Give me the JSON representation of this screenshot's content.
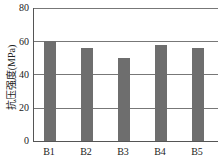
{
  "chart_data": {
    "type": "bar",
    "title": "",
    "xlabel": "",
    "ylabel": "抗压强度(MPa)",
    "categories": [
      "B1",
      "B2",
      "B3",
      "B4",
      "B5"
    ],
    "values": [
      60,
      56,
      50,
      57.5,
      56
    ],
    "ylim": [
      0,
      80
    ],
    "yticks": [
      "0",
      "20",
      "40",
      "60",
      "80"
    ],
    "grid": true,
    "legend": null,
    "bar_color": "#6e6e6e"
  }
}
